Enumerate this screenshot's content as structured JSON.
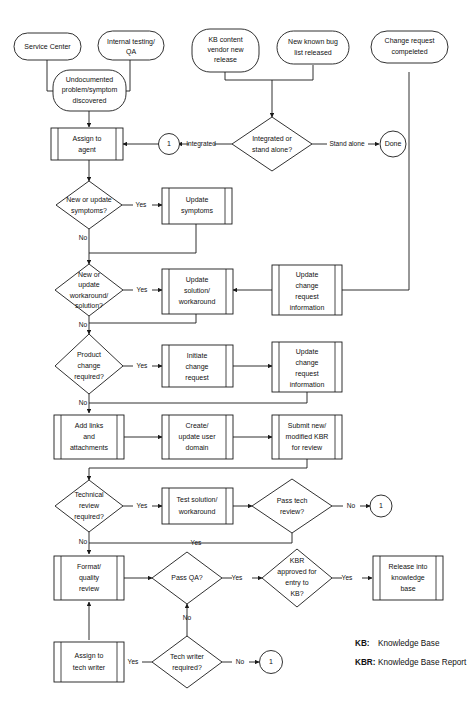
{
  "diagram": {
    "background_color": "#ffffff",
    "stroke_color": "#1a1a1a",
    "text_color": "#111111"
  },
  "nodes": {
    "service_center": {
      "label": "Service Center",
      "shape": "terminator"
    },
    "internal_testing": {
      "line1": "Internal testing/",
      "line2": "QA",
      "shape": "terminator"
    },
    "kb_vendor": {
      "line1": "KB content",
      "line2": "vendor new",
      "line3": "release",
      "shape": "terminator"
    },
    "new_bug_list": {
      "line1": "New known bug",
      "line2": "list released",
      "shape": "terminator"
    },
    "change_request_completed": {
      "line1": "Change request",
      "line2": "compeleted",
      "shape": "terminator"
    },
    "undocumented": {
      "line1": "Undocumented",
      "line2": "problem/symptom",
      "line3": "discovered",
      "shape": "terminator"
    },
    "assign_agent": {
      "line1": "Assign to",
      "line2": "agent",
      "shape": "predefined-process"
    },
    "connector_1_top": {
      "label": "1",
      "shape": "connector"
    },
    "integrated_or_standalone": {
      "line1": "Integrated or",
      "line2": "stand alone?",
      "shape": "decision"
    },
    "done": {
      "label": "Done",
      "shape": "connector"
    },
    "new_update_symptoms": {
      "line1": "New or update",
      "line2": "symptoms?",
      "shape": "decision"
    },
    "update_symptoms": {
      "line1": "Update",
      "line2": "symptoms",
      "shape": "predefined-process"
    },
    "new_update_workaround": {
      "line1": "New or",
      "line2": "update",
      "line3": "workaround/",
      "line4": "solution?",
      "shape": "decision"
    },
    "update_solution": {
      "line1": "Update",
      "line2": "solution/",
      "line3": "workaround",
      "shape": "predefined-process"
    },
    "update_change_req_info_top": {
      "line1": "Update",
      "line2": "change",
      "line3": "request",
      "line4": "information",
      "shape": "predefined-process"
    },
    "product_change_required": {
      "line1": "Product",
      "line2": "change",
      "line3": "required?",
      "shape": "decision"
    },
    "initiate_change_request": {
      "line1": "Initiate",
      "line2": "change",
      "line3": "request",
      "shape": "predefined-process"
    },
    "update_change_req_info_bottom": {
      "line1": "Update",
      "line2": "change",
      "line3": "request",
      "line4": "information",
      "shape": "predefined-process"
    },
    "add_links": {
      "line1": "Add links",
      "line2": "and",
      "line3": "attachments",
      "shape": "predefined-process"
    },
    "create_update_user_domain": {
      "line1": "Create/",
      "line2": "update user",
      "line3": "domain",
      "shape": "predefined-process"
    },
    "submit_kbr": {
      "line1": "Submit new/",
      "line2": "modified KBR",
      "line3": "for review",
      "shape": "predefined-process"
    },
    "technical_review_required": {
      "line1": "Technical",
      "line2": "review",
      "line3": "required?",
      "shape": "decision"
    },
    "test_solution": {
      "line1": "Test solution/",
      "line2": "workaround",
      "shape": "predefined-process"
    },
    "pass_tech_review": {
      "line1": "Pass tech",
      "line2": "review?",
      "shape": "decision"
    },
    "connector_1_tech": {
      "label": "1",
      "shape": "connector"
    },
    "format_quality_review": {
      "line1": "Format/",
      "line2": "quality",
      "line3": "review",
      "shape": "predefined-process"
    },
    "pass_qa": {
      "label": "Pass QA?",
      "shape": "decision"
    },
    "kbr_approved": {
      "line1": "KBR",
      "line2": "approved for",
      "line3": "entry to",
      "line4": "KB?",
      "shape": "decision"
    },
    "release_into_kb": {
      "line1": "Release into",
      "line2": "knowledge",
      "line3": "base",
      "shape": "predefined-process"
    },
    "assign_tech_writer": {
      "line1": "Assign to",
      "line2": "tech writer",
      "shape": "predefined-process"
    },
    "tech_writer_required": {
      "line1": "Tech writer",
      "line2": "required?",
      "shape": "decision"
    },
    "connector_1_techwriter": {
      "label": "1",
      "shape": "connector"
    }
  },
  "edge_labels": {
    "integrated": "Integrated",
    "stand_alone": "Stand alone",
    "symptoms_yes": "Yes",
    "symptoms_no": "No",
    "workaround_yes": "Yes",
    "workaround_no": "No",
    "product_yes": "Yes",
    "product_no": "No",
    "tech_review_yes": "Yes",
    "tech_review_no": "No",
    "pass_tech_no": "No",
    "pass_tech_yes": "Yes",
    "pass_qa_yes": "Yes",
    "pass_qa_no": "No",
    "kbr_approved_yes": "Yes",
    "tech_writer_yes": "Yes",
    "tech_writer_no": "No"
  },
  "legend": {
    "rows": [
      {
        "key": "KB:",
        "value": "Knowledge Base"
      },
      {
        "key": "KBR:",
        "value": "Knowledge Base Report"
      }
    ]
  }
}
